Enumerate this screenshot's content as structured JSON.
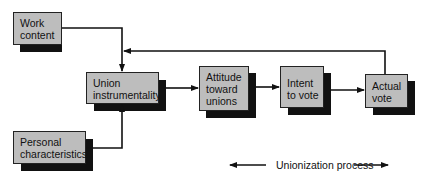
{
  "diagram": {
    "nodes": {
      "work_content": {
        "lines": [
          "Work",
          "content"
        ]
      },
      "personal_characteristics": {
        "lines": [
          "Personal",
          "characteristics"
        ]
      },
      "union_instrumentality": {
        "lines": [
          "Union",
          "instrumentality"
        ]
      },
      "attitude_toward_unions": {
        "lines": [
          "Attitude",
          "toward",
          "unions"
        ]
      },
      "intent_to_vote": {
        "lines": [
          "Intent",
          "to vote"
        ]
      },
      "actual_vote": {
        "lines": [
          "Actual",
          "vote"
        ]
      }
    },
    "edges": [
      {
        "from": "work_content",
        "to": "union_instrumentality"
      },
      {
        "from": "personal_characteristics",
        "to": "union_instrumentality"
      },
      {
        "from": "union_instrumentality",
        "to": "attitude_toward_unions"
      },
      {
        "from": "attitude_toward_unions",
        "to": "intent_to_vote"
      },
      {
        "from": "intent_to_vote",
        "to": "actual_vote"
      },
      {
        "from": "actual_vote",
        "to": "union_instrumentality",
        "type": "feedback"
      }
    ],
    "legend": {
      "label": "Unionization process"
    },
    "colors": {
      "box_fill": "#bdbdbd",
      "shadow": "#111111",
      "line": "#111111"
    }
  }
}
